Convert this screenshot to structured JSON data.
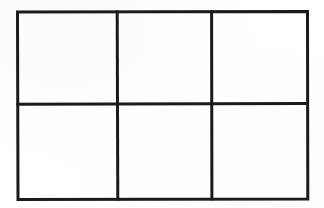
{
  "figure": {
    "background_color": "#ffffff",
    "paper_color": "#fefefe",
    "stroke_color": "#1a1a1a",
    "outer_stroke_width": 3,
    "inner_stroke_width": 3,
    "rows": 2,
    "columns": 3,
    "cell_count": 6,
    "outer_rect": {
      "left": 17,
      "top": 11,
      "right": 308,
      "bottom": 200,
      "width": 291,
      "height": 189
    },
    "vertical_dividers_x": [
      117,
      211
    ],
    "horizontal_dividers_y": [
      104
    ],
    "cells": [
      {
        "id": "cell-r1-c1",
        "row": 1,
        "column": 1,
        "label": "",
        "x": 17,
        "y": 11,
        "width": 100,
        "height": 93
      },
      {
        "id": "cell-r1-c2",
        "row": 1,
        "column": 2,
        "label": "",
        "x": 117,
        "y": 11,
        "width": 94,
        "height": 93
      },
      {
        "id": "cell-r1-c3",
        "row": 1,
        "column": 3,
        "label": "",
        "x": 211,
        "y": 11,
        "width": 97,
        "height": 93
      },
      {
        "id": "cell-r2-c1",
        "row": 2,
        "column": 1,
        "label": "",
        "x": 17,
        "y": 104,
        "width": 100,
        "height": 96
      },
      {
        "id": "cell-r2-c2",
        "row": 2,
        "column": 2,
        "label": "",
        "x": 117,
        "y": 104,
        "width": 94,
        "height": 96
      },
      {
        "id": "cell-r2-c3",
        "row": 2,
        "column": 3,
        "label": "",
        "x": 211,
        "y": 104,
        "width": 97,
        "height": 96
      }
    ]
  }
}
